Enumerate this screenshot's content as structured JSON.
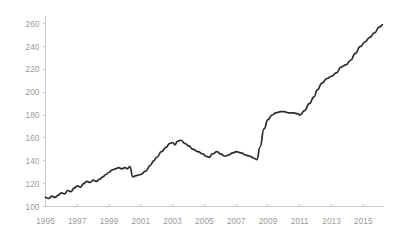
{
  "chart_data": {
    "type": "line",
    "title": "",
    "subtitle": "",
    "xlabel": "",
    "ylabel": "",
    "xlim": [
      1995,
      2016.3
    ],
    "ylim": [
      100,
      265
    ],
    "grid": false,
    "legend": null,
    "line_color": "#2b2b2b",
    "axis_color": "#c9c9c9",
    "tick_label_color": "#9a9a9a",
    "yticks": [
      100,
      120,
      140,
      160,
      180,
      200,
      220,
      240,
      260
    ],
    "ytick_labels": [
      "100",
      "120",
      "140",
      "160",
      "180",
      "200",
      "220",
      "240",
      "260"
    ],
    "xticks": [
      1995,
      1997,
      1999,
      2001,
      2003,
      2005,
      2007,
      2009,
      2011,
      2013,
      2015
    ],
    "xtick_labels": [
      "1995",
      "1997",
      "1999",
      "2001",
      "2003",
      "2005",
      "2007",
      "2009",
      "2011",
      "2013",
      "2015"
    ],
    "series": [
      {
        "name": "index",
        "x": [
          1995.0,
          1995.2,
          1995.4,
          1995.6,
          1995.8,
          1996.0,
          1996.2,
          1996.4,
          1996.6,
          1996.8,
          1997.0,
          1997.2,
          1997.4,
          1997.6,
          1997.8,
          1998.0,
          1998.2,
          1998.4,
          1998.6,
          1998.8,
          1999.0,
          1999.2,
          1999.4,
          1999.6,
          1999.8,
          2000.0,
          2000.15,
          2000.3,
          2000.5,
          2000.7,
          2001.0,
          2001.3,
          2001.6,
          2001.8,
          2002.0,
          2002.3,
          2002.6,
          2002.8,
          2003.0,
          2003.15,
          2003.3,
          2003.5,
          2003.8,
          2004.0,
          2004.3,
          2004.6,
          2004.9,
          2005.1,
          2005.3,
          2005.5,
          2005.8,
          2006.0,
          2006.3,
          2006.5,
          2006.8,
          2007.0,
          2007.3,
          2007.6,
          2007.9,
          2008.0,
          2008.15,
          2008.3,
          2008.5,
          2008.75,
          2009.0,
          2009.25,
          2009.5,
          2009.8,
          2010.0,
          2010.3,
          2010.6,
          2010.9,
          2011.0,
          2011.3,
          2011.6,
          2011.9,
          2012.1,
          2012.4,
          2012.7,
          2013.0,
          2013.3,
          2013.6,
          2013.9,
          2014.2,
          2014.5,
          2014.8,
          2015.1,
          2015.4,
          2015.7,
          2016.0,
          2016.2
        ],
        "values": [
          108,
          107,
          109,
          108,
          110,
          112,
          111,
          114,
          113,
          116,
          118,
          117,
          120,
          122,
          121,
          123,
          122,
          124,
          126,
          128,
          130,
          132,
          133,
          134,
          133,
          134,
          133,
          135,
          126,
          127,
          128,
          131,
          136,
          140,
          143,
          148,
          152,
          155,
          156,
          154,
          157,
          158,
          155,
          153,
          150,
          148,
          146,
          144,
          143,
          146,
          148,
          146,
          144,
          145,
          147,
          148,
          147,
          145,
          144,
          143,
          142,
          141,
          152,
          168,
          176,
          180,
          182,
          183,
          183,
          182,
          182,
          181,
          180,
          184,
          190,
          196,
          202,
          208,
          212,
          214,
          217,
          222,
          224,
          228,
          234,
          240,
          244,
          248,
          252,
          257,
          259
        ]
      }
    ]
  },
  "axis": {
    "y_axis_name": "value-axis",
    "x_axis_name": "year-axis"
  }
}
